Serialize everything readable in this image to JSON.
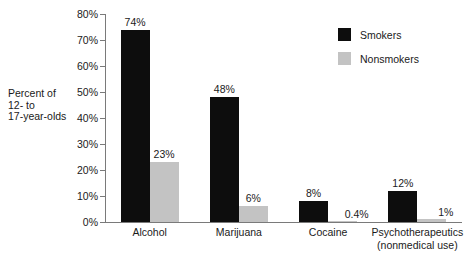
{
  "chart_data": {
    "type": "bar",
    "title": "",
    "xlabel": "",
    "ylabel": "Percent of 12- to 17-year-olds",
    "ylim": [
      0,
      80
    ],
    "grid": false,
    "legend_position": "top-right",
    "categories": [
      "Alcohol",
      "Marijuana",
      "Cocaine",
      "Psychotherapeutics (nonmedical use)"
    ],
    "series": [
      {
        "name": "Smokers",
        "color": "#0d0d0d",
        "values": [
          74,
          48,
          8,
          12
        ],
        "labels": [
          "74%",
          "48%",
          "8%",
          "12%"
        ]
      },
      {
        "name": "Nonsmokers",
        "color": "#c3c3c3",
        "values": [
          23,
          6,
          0.4,
          1
        ],
        "labels": [
          "23%",
          "6%",
          "0.4%",
          "1%"
        ]
      }
    ],
    "ytick_labels": [
      "0%",
      "10%",
      "20%",
      "30%",
      "40%",
      "50%",
      "60%",
      "70%",
      "80%"
    ],
    "ytick_values": [
      0,
      10,
      20,
      30,
      40,
      50,
      60,
      70,
      80
    ]
  },
  "axis_title_lines": [
    "Percent of",
    "12- to",
    "17-year-olds"
  ],
  "category_labels": [
    {
      "line1": "Alcohol",
      "line2": ""
    },
    {
      "line1": "Marijuana",
      "line2": ""
    },
    {
      "line1": "Cocaine",
      "line2": ""
    },
    {
      "line1": "Psychotherapeutics",
      "line2": "(nonmedical use)"
    }
  ],
  "legend": {
    "items": [
      {
        "label": "Smokers"
      },
      {
        "label": "Nonsmokers"
      }
    ]
  },
  "colors": {
    "smokers": "#0d0d0d",
    "nonsmokers": "#c3c3c3",
    "axis": "#7a7a7a",
    "text": "#1a1a1a",
    "background": "#ffffff"
  }
}
